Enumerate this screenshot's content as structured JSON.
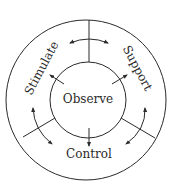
{
  "diagram": {
    "center_label": "Observe",
    "segments": [
      {
        "label": "Stimulate",
        "position": "upper-left"
      },
      {
        "label": "Support",
        "position": "upper-right"
      },
      {
        "label": "Control",
        "position": "bottom"
      }
    ],
    "colors": {
      "stroke": "#2a2a2a",
      "background": "#ffffff"
    }
  }
}
